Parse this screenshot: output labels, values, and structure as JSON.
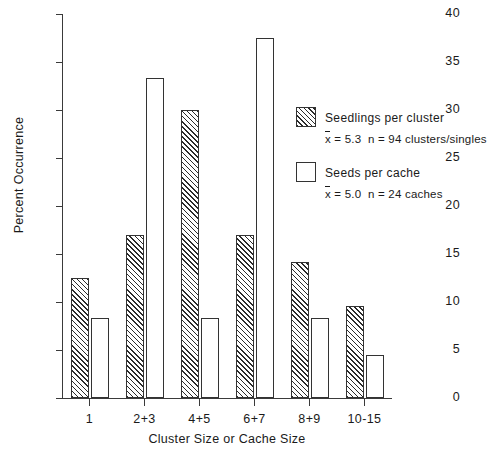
{
  "chart_data": {
    "type": "bar",
    "title": "",
    "xlabel": "Cluster Size or Cache Size",
    "ylabel": "Percent Occurrence",
    "categories": [
      "1",
      "2+3",
      "4+5",
      "6+7",
      "8+9",
      "10-15"
    ],
    "ylim": [
      0,
      40
    ],
    "yticks": [
      0,
      5,
      10,
      15,
      20,
      25,
      30,
      35,
      40
    ],
    "grid": false,
    "legend_position": "upper right",
    "series": [
      {
        "name": "Seedlings per cluster",
        "style": "hatched",
        "mean_label": "x̄ = 5.3",
        "n_label": "n = 94 clusters/singles",
        "values": [
          12.5,
          17.0,
          30.0,
          17.0,
          14.2,
          9.6
        ]
      },
      {
        "name": "Seeds per cache",
        "style": "open",
        "mean_label": "x̄ = 5.0",
        "n_label": "n = 24 caches",
        "values": [
          8.3,
          33.3,
          8.3,
          37.5,
          8.3,
          4.5
        ]
      }
    ]
  },
  "axis": {
    "y_tick_labels": [
      "0",
      "5",
      "10",
      "15",
      "20",
      "25",
      "30",
      "35",
      "40"
    ],
    "y_title": "Percent Occurrence",
    "x_title": "Cluster Size or Cache Size",
    "x_tick_labels": [
      "1",
      "2+3",
      "4+5",
      "6+7",
      "8+9",
      "10-15"
    ]
  },
  "legend": {
    "entries": [
      {
        "swatch": "hatched",
        "title": "Seedlings per cluster",
        "stats_mean": "= 5.3",
        "stats_n": "n = 94 clusters/singles"
      },
      {
        "swatch": "open",
        "title": "Seeds per cache",
        "stats_mean": "= 5.0",
        "stats_n": "n = 24 caches"
      }
    ]
  }
}
